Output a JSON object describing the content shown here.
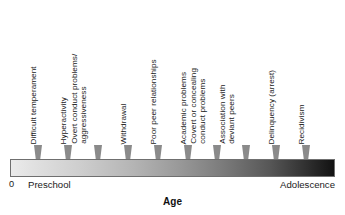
{
  "chart_data": {
    "type": "timeline",
    "title": "",
    "xlabel": "Age",
    "ylabel": "",
    "axis": {
      "start_tick_label": "0",
      "start_label": "Preschool",
      "end_label": "Adolescence",
      "gradient_from": "#ebebeb",
      "gradient_to": "#121212",
      "grid": false,
      "orientation": "horizontal"
    },
    "marker_color": "#8a8a8a",
    "markers": [
      {
        "label": "Difficult temperament",
        "x_px": 38,
        "lines": 1
      },
      {
        "label": "Hyperactivity",
        "x_px": 68,
        "lines": 1
      },
      {
        "label": "Overt conduct problems/\naggressiveness",
        "x_px": 98,
        "lines": 2
      },
      {
        "label": "Withdrawal",
        "x_px": 128,
        "lines": 1
      },
      {
        "label": "Poor peer relationships",
        "x_px": 158,
        "lines": 1
      },
      {
        "label": "Academic problems",
        "x_px": 188,
        "lines": 1
      },
      {
        "label": "Covert or concealing\nconduct problems",
        "x_px": 217,
        "lines": 2
      },
      {
        "label": "Association with\ndeviant peers",
        "x_px": 246,
        "lines": 2
      },
      {
        "label": "Delinquency (arrest)",
        "x_px": 276,
        "lines": 1
      },
      {
        "label": "Recidivism",
        "x_px": 306,
        "lines": 1
      }
    ]
  },
  "axis_title": "Age",
  "axis_zero": "0",
  "axis_start": "Preschool",
  "axis_end": "Adolescence"
}
